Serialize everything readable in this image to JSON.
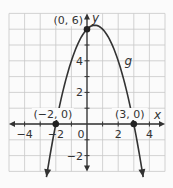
{
  "chart_data": {
    "type": "line",
    "title": "",
    "xlabel": "x",
    "ylabel": "y",
    "xlim": [
      -5,
      5
    ],
    "ylim": [
      -3,
      7
    ],
    "grid": true,
    "x_ticks": [
      {
        "value": -4,
        "label": "−4"
      },
      {
        "value": -2,
        "label": "−2"
      },
      {
        "value": 0,
        "label": "0"
      },
      {
        "value": 2,
        "label": "2"
      },
      {
        "value": 4,
        "label": "4"
      }
    ],
    "y_ticks": [
      {
        "value": -2,
        "label": "−2"
      },
      {
        "value": 2,
        "label": "2"
      },
      {
        "value": 4,
        "label": "4"
      }
    ],
    "series": [
      {
        "name": "g",
        "equation": "g(x) = -(x + 2)(x - 3)",
        "x": [
          -2.6,
          -2,
          -1,
          0,
          0.5,
          1,
          2,
          3,
          3.6
        ],
        "y": [
          -3.36,
          0,
          4,
          6,
          6.25,
          6,
          4,
          0,
          -3.36
        ]
      }
    ],
    "annotations": [
      {
        "label": "(0, 6)",
        "x": 0,
        "y": 6
      },
      {
        "label": "(−2, 0)",
        "x": -2,
        "y": 0
      },
      {
        "label": "(3, 0)",
        "x": 3,
        "y": 0
      },
      {
        "label": "g",
        "x": 2.4,
        "y": 4.0
      }
    ],
    "colors": {
      "grid": "#c8c8c8",
      "axis": "#333333",
      "curve": "#333333",
      "point": "#222222"
    }
  }
}
